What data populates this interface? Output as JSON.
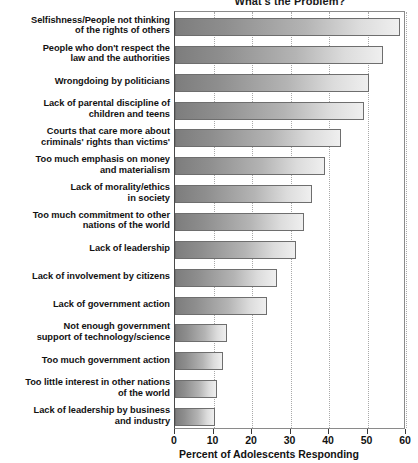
{
  "chart_data": {
    "type": "bar",
    "orientation": "horizontal",
    "title": "What's the Problem?",
    "xlabel": "Percent of Adolescents Responding",
    "ylabel": "",
    "xlim": [
      0,
      60
    ],
    "xticks": [
      0,
      10,
      20,
      30,
      40,
      50,
      60
    ],
    "grid": true,
    "legend": "none",
    "categories": [
      "Selfishness/People not thinking of the rights of others",
      "People who don't respect the law and the authorities",
      "Wrongdoing by politicians",
      "Lack of parental discipline of children and teens",
      "Courts that care more about criminals' rights than victims'",
      "Too much emphasis on money and materialism",
      "Lack of morality/ethics in society",
      "Too much commitment to other nations of the world",
      "Lack of leadership",
      "Lack of involvement by citizens",
      "Lack of government action",
      "Not enough government support of technology/science",
      "Too much government action",
      "Too little interest in other nations of the world",
      "Lack of leadership by business and industry"
    ],
    "category_lines": [
      [
        "Selfishness/People not thinking",
        "of the rights of others"
      ],
      [
        "People who don't respect the",
        "law and the authorities"
      ],
      [
        "Wrongdoing by politicians"
      ],
      [
        "Lack of parental discipline of",
        "children and teens"
      ],
      [
        "Courts that care more about",
        "criminals' rights than victims'"
      ],
      [
        "Too much emphasis on money",
        "and materialism"
      ],
      [
        "Lack of morality/ethics",
        "in society"
      ],
      [
        "Too much commitment to other",
        "nations of the world"
      ],
      [
        "Lack of leadership"
      ],
      [
        "Lack of involvement by citizens"
      ],
      [
        "Lack of government action"
      ],
      [
        "Not enough government",
        "support of technology/science"
      ],
      [
        "Too much government action"
      ],
      [
        "Too little interest in other nations",
        "of the world"
      ],
      [
        "Lack of leadership by business",
        "and industry"
      ]
    ],
    "values": [
      58.5,
      54,
      50.5,
      49,
      43,
      39,
      35.5,
      33.5,
      31.5,
      26.5,
      24,
      13.5,
      12.5,
      11,
      10.5
    ]
  },
  "colors": {
    "bar_gradient_start": "#7d7d7d",
    "bar_gradient_end": "#efefef",
    "bar_border": "#6e6e6e",
    "gridline": "#a9a9a9",
    "axis": "#3a3a3a",
    "text": "#121212",
    "background": "#ffffff"
  }
}
